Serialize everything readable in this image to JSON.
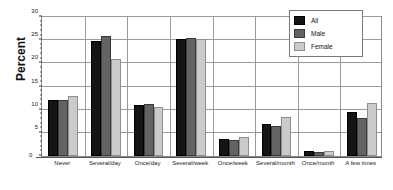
{
  "chart_data": {
    "type": "bar",
    "title": "",
    "subtitle": "",
    "xlabel": "",
    "ylabel": "Percent",
    "ylim": [
      0,
      30
    ],
    "yticks": [
      0,
      5,
      10,
      15,
      20,
      25,
      30
    ],
    "ytick_labels": [
      "0",
      "5",
      "10",
      "15",
      "20",
      "25",
      "30"
    ],
    "grid": "horizontal-and-vertical",
    "legend_position": "top-right",
    "categories": [
      "Never",
      "Several/day",
      "Once/day",
      "Several/week",
      "Once/week",
      "Several/month",
      "Once/month",
      "A few times"
    ],
    "series": [
      {
        "name": "All",
        "color": "#141414",
        "values": [
          12.1,
          24.8,
          11.0,
          25.3,
          3.7,
          7.0,
          1.0,
          9.5
        ]
      },
      {
        "name": "Male",
        "color": "#636363",
        "values": [
          12.1,
          26.0,
          11.2,
          25.5,
          3.4,
          6.5,
          0.9,
          8.2
        ]
      },
      {
        "name": "Female",
        "color": "#cbcbcb",
        "values": [
          13.0,
          21.0,
          10.6,
          25.2,
          4.0,
          8.5,
          1.1,
          11.5
        ]
      }
    ]
  },
  "legend": {
    "items": [
      {
        "label": "All"
      },
      {
        "label": "Male"
      },
      {
        "label": "Female"
      }
    ]
  },
  "axis": {
    "y_title": "Percent",
    "zero_label": "0"
  }
}
